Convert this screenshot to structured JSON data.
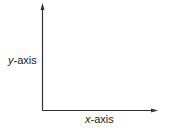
{
  "diagram": {
    "type": "coordinate-axes",
    "y_axis": {
      "var": "y",
      "suffix": "-axis"
    },
    "x_axis": {
      "var": "x",
      "suffix": "-axis"
    },
    "colors": {
      "axis": "#333333",
      "text": "#222222",
      "background": "#ffffff"
    }
  }
}
